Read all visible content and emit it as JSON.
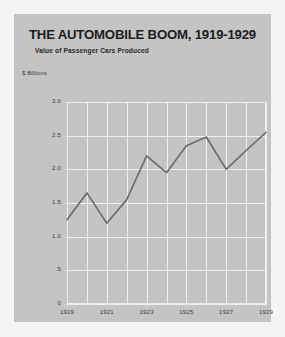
{
  "card": {
    "title": "THE AUTOMOBILE BOOM, 1919-1929",
    "subtitle": "Value of Passenger Cars Produced",
    "unit_label": "$ Billions",
    "background_color": "#c4c4c4",
    "page_background_color": "#f4f4f4",
    "line_color": "#6b6b6b",
    "grid_color": "#f1f1f1",
    "text_color": "#1c1c1c"
  },
  "chart_data": {
    "type": "line",
    "title": "THE AUTOMOBILE BOOM, 1919-1929",
    "subtitle": "Value of Passenger Cars Produced",
    "xlabel": "",
    "ylabel": "$ Billions",
    "x": [
      1919,
      1920,
      1921,
      1922,
      1923,
      1924,
      1925,
      1926,
      1927,
      1928,
      1929
    ],
    "values": [
      1.25,
      1.65,
      1.2,
      1.55,
      2.2,
      1.95,
      2.35,
      2.48,
      2.0,
      2.28,
      2.55
    ],
    "xlim": [
      1919,
      1929
    ],
    "ylim": [
      0,
      3.0
    ],
    "ytick_values": [
      0,
      0.5,
      1.0,
      1.5,
      2.0,
      2.5,
      3.0
    ],
    "ytick_labels": [
      "0",
      ".5",
      "1.0",
      "1.5",
      "2.0",
      "2.5",
      "3.0"
    ],
    "xtick_values": [
      1919,
      1921,
      1923,
      1925,
      1927,
      1929
    ],
    "xtick_labels": [
      "1919",
      "1921",
      "1923",
      "1925",
      "1927",
      "1929"
    ],
    "grid": true,
    "grid_vertical_every": 1,
    "legend": null,
    "series": [
      {
        "name": "Value of Passenger Cars Produced",
        "values": [
          1.25,
          1.65,
          1.2,
          1.55,
          2.2,
          1.95,
          2.35,
          2.48,
          2.0,
          2.28,
          2.55
        ]
      }
    ]
  }
}
